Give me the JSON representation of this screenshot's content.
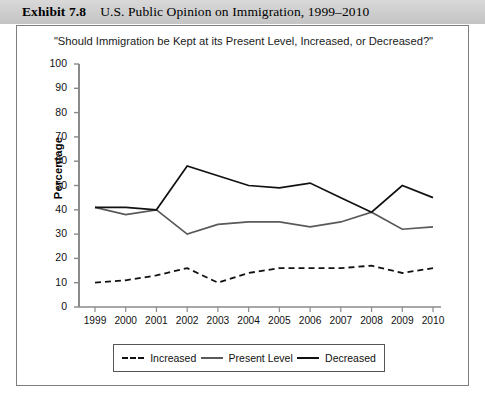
{
  "exhibit": {
    "label": "Exhibit 7.8",
    "title": "U.S. Public Opinion on Immigration, 1999–2010"
  },
  "chart_data": {
    "type": "line",
    "title": "\"Should Immigration be Kept at its Present Level, Increased, or Decreased?\"",
    "xlabel": "",
    "ylabel": "Percentage",
    "ylim": [
      0,
      100
    ],
    "ytick_step": 10,
    "yticks": [
      "100",
      "90",
      "80",
      "70",
      "60",
      "50",
      "40",
      "30",
      "20",
      "10",
      "0"
    ],
    "grid": false,
    "legend_position": "bottom",
    "categories": [
      "1999",
      "2000",
      "2001",
      "2002",
      "2003",
      "2004",
      "2005",
      "2006",
      "2007",
      "2008",
      "2009",
      "2010"
    ],
    "series": [
      {
        "name": "Increased",
        "style": "dashed",
        "color": "#111111",
        "values": [
          10,
          11,
          13,
          16,
          10,
          14,
          16,
          16,
          16,
          17,
          14,
          16
        ]
      },
      {
        "name": "Present Level",
        "style": "solid",
        "color": "#58595b",
        "values": [
          41,
          38,
          40,
          30,
          34,
          35,
          35,
          33,
          35,
          39,
          32,
          33
        ]
      },
      {
        "name": "Decreased",
        "style": "solid",
        "color": "#111111",
        "values": [
          41,
          41,
          40,
          58,
          54,
          50,
          49,
          51,
          45,
          39,
          50,
          45
        ]
      }
    ]
  }
}
